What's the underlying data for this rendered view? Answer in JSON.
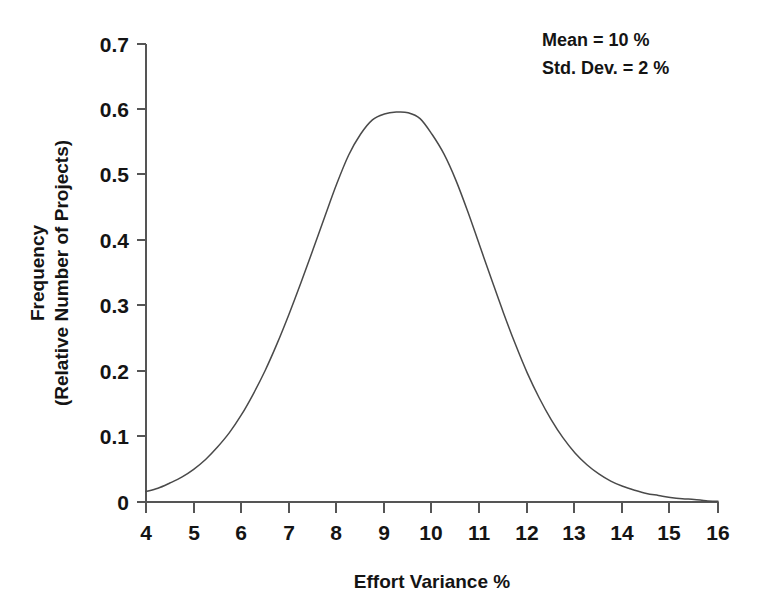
{
  "chart_data": {
    "type": "line",
    "title": "",
    "subtitle": "",
    "xlabel": "Effort Variance %",
    "ylabel_line1": "Frequency",
    "ylabel_line2": "(Relative Number of Projects)",
    "xlim": [
      4,
      16
    ],
    "ylim": [
      0,
      0.7
    ],
    "xticks": [
      4,
      5,
      6,
      7,
      8,
      9,
      10,
      11,
      12,
      13,
      14,
      15,
      16
    ],
    "xticklabels": [
      "4",
      "5",
      "6",
      "7",
      "8",
      "9",
      "10",
      "11",
      "12",
      "13",
      "14",
      "15",
      "16"
    ],
    "yticks": [
      0,
      0.1,
      0.2,
      0.3,
      0.4,
      0.5,
      0.6,
      0.7
    ],
    "yticklabels": [
      "0",
      "0.1",
      "0.2",
      "0.3",
      "0.4",
      "0.5",
      "0.6",
      "0.7"
    ],
    "grid": false,
    "legend": false,
    "legend_position": "none",
    "line_color": "#4a4a4a",
    "distribution": {
      "shape": "normal",
      "peak_x": 9.5,
      "peak_y": 0.595,
      "sigma_px_units": 1.5
    },
    "series": [
      {
        "name": "Effort Variance Distribution",
        "x": [
          4.0,
          4.25,
          4.5,
          4.75,
          5.0,
          5.25,
          5.5,
          5.75,
          6.0,
          6.25,
          6.5,
          6.75,
          7.0,
          7.25,
          7.5,
          7.75,
          8.0,
          8.25,
          8.5,
          8.75,
          9.0,
          9.25,
          9.5,
          9.75,
          10.0,
          10.25,
          10.5,
          10.75,
          11.0,
          11.25,
          11.5,
          11.75,
          12.0,
          12.25,
          12.5,
          12.75,
          13.0,
          13.25,
          13.5,
          13.75,
          14.0,
          14.25,
          14.5,
          14.75,
          15.0,
          15.25,
          15.5,
          15.75,
          16.0
        ],
        "y": [
          0.016,
          0.021,
          0.029,
          0.038,
          0.05,
          0.065,
          0.084,
          0.106,
          0.133,
          0.165,
          0.201,
          0.242,
          0.287,
          0.335,
          0.385,
          0.436,
          0.486,
          0.53,
          0.562,
          0.584,
          0.593,
          0.596,
          0.595,
          0.586,
          0.562,
          0.532,
          0.492,
          0.444,
          0.392,
          0.34,
          0.289,
          0.241,
          0.197,
          0.159,
          0.126,
          0.098,
          0.075,
          0.057,
          0.043,
          0.032,
          0.024,
          0.018,
          0.013,
          0.01,
          0.007,
          0.005,
          0.004,
          0.002,
          0.001
        ]
      }
    ],
    "annotations": [
      {
        "id": "mean",
        "text": "Mean = 10 %"
      },
      {
        "id": "stddev",
        "text": "Std. Dev. = 2 %"
      }
    ]
  }
}
